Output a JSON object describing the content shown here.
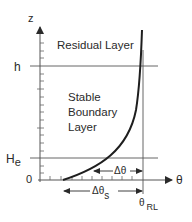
{
  "diagram": {
    "axes": {
      "y_label": "z",
      "x_label": "θ",
      "origin_label": "0"
    },
    "levels": {
      "h_label": "h",
      "he_label": "H",
      "he_subscript": "e"
    },
    "regions": {
      "residual": "Residual Layer",
      "stable_line1": "Stable",
      "stable_line2": "Boundary",
      "stable_line3": "Layer"
    },
    "annotations": {
      "delta_theta": "Δθ",
      "delta_theta_s": "Δθ",
      "delta_theta_s_subscript": "s",
      "theta_rl": "θ",
      "theta_rl_subscript": "RL"
    },
    "colors": {
      "line": "#2a2a2a",
      "thin_line": "#555555",
      "background": "#ffffff"
    }
  }
}
